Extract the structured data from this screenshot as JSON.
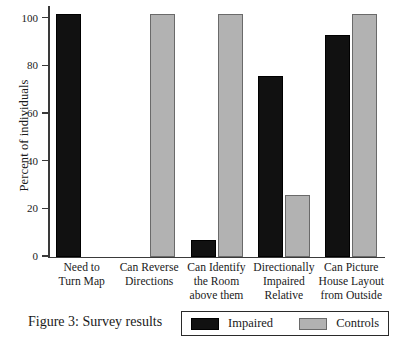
{
  "chart_data": {
    "type": "bar",
    "title": "",
    "caption": "Figure 3: Survey results",
    "xlabel": "",
    "ylabel": "Percent of individuals",
    "ylim": [
      0,
      105
    ],
    "yticks": [
      0,
      20,
      40,
      60,
      80,
      100
    ],
    "ytick_labels": [
      "0",
      "20",
      "40",
      "60",
      "80",
      "100"
    ],
    "grid": false,
    "legend_position": "bottom-right",
    "categories": [
      "Need to\nTurn Map",
      "Can Reverse\nDirections",
      "Can Identify\nthe Room\nabove them",
      "Directionally\nImpaired\nRelative",
      "Can Picture\nHouse Layout\nfrom Outside"
    ],
    "category_lines": [
      [
        "Need to",
        "Turn Map"
      ],
      [
        "Can Reverse",
        "Directions"
      ],
      [
        "Can Identify",
        "the Room",
        "above them"
      ],
      [
        "Directionally",
        "Impaired",
        "Relative"
      ],
      [
        "Can Picture",
        "House Layout",
        "from Outside"
      ]
    ],
    "series": [
      {
        "name": "Impaired",
        "color": "#111111",
        "values": [
          102,
          0,
          7,
          76,
          93
        ]
      },
      {
        "name": "Controls",
        "color": "#b2b2b2",
        "values": [
          0,
          102,
          102,
          26,
          102
        ]
      }
    ]
  },
  "legend": {
    "entries": [
      {
        "label": "Impaired",
        "color": "#111111"
      },
      {
        "label": "Controls",
        "color": "#b2b2b2"
      }
    ]
  },
  "colors": {
    "impaired": "#111111",
    "controls": "#b2b2b2",
    "axis": "#3a3a3a",
    "background": "#ffffff",
    "text": "#1a1a1a"
  }
}
